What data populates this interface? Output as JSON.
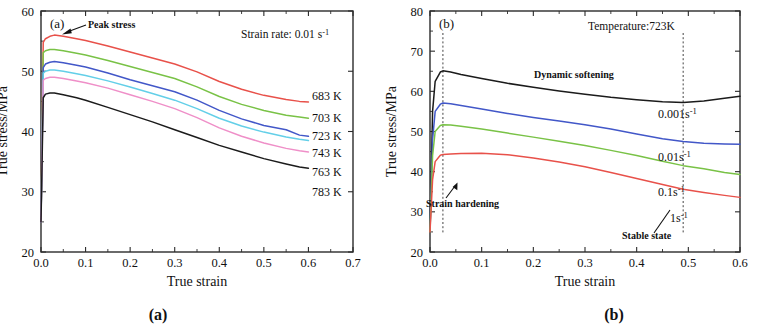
{
  "figure": {
    "caption_a": "(a)",
    "caption_b": "(b)"
  },
  "chart_data": [
    {
      "type": "line",
      "panel_label": "(a)",
      "title": "",
      "xlabel": "True strain",
      "ylabel": "True stress/MPa",
      "xlim": [
        0.0,
        0.7
      ],
      "ylim": [
        20,
        60
      ],
      "xticks": [
        "0.0",
        "0.1",
        "0.2",
        "0.3",
        "0.4",
        "0.5",
        "0.6",
        "0.7"
      ],
      "yticks": [
        "20",
        "30",
        "40",
        "50",
        "60"
      ],
      "grid": false,
      "legend_position": "right-inline",
      "annotations": [
        {
          "name": "condition-note",
          "text": "Strain rate: 0.01 s⁻¹"
        },
        {
          "name": "peak-stress-note",
          "text": "Peak stress"
        }
      ],
      "x": [
        0.0,
        0.005,
        0.01,
        0.02,
        0.03,
        0.05,
        0.08,
        0.1,
        0.15,
        0.2,
        0.25,
        0.3,
        0.35,
        0.4,
        0.45,
        0.5,
        0.55,
        0.58,
        0.6
      ],
      "series": [
        {
          "name": "683 K",
          "color": "#e8514a",
          "values": [
            25.0,
            54.8,
            55.4,
            55.8,
            56.0,
            55.8,
            55.4,
            55.1,
            54.2,
            53.2,
            52.2,
            51.2,
            49.9,
            48.3,
            47.0,
            46.0,
            45.3,
            45.0,
            44.9
          ]
        },
        {
          "name": "703 K",
          "color": "#79c246",
          "values": [
            25.0,
            53.1,
            53.4,
            53.6,
            53.6,
            53.4,
            53.0,
            52.7,
            51.8,
            50.8,
            49.8,
            48.8,
            47.4,
            45.8,
            44.5,
            43.5,
            42.7,
            42.4,
            42.2
          ]
        },
        {
          "name": "723 K",
          "color": "#4257c8",
          "values": [
            25.0,
            50.6,
            51.2,
            51.5,
            51.6,
            51.4,
            51.0,
            50.7,
            49.7,
            48.6,
            47.6,
            46.6,
            45.2,
            43.5,
            42.1,
            41.0,
            40.3,
            39.4,
            39.2
          ]
        },
        {
          "name": "743 K",
          "color": "#63cfe8",
          "values": [
            25.0,
            49.7,
            50.0,
            50.2,
            50.2,
            50.0,
            49.6,
            49.3,
            48.4,
            47.4,
            46.3,
            45.2,
            43.8,
            42.2,
            40.9,
            39.9,
            39.1,
            38.7,
            38.5
          ]
        },
        {
          "name": "763 K",
          "color": "#ef8fc8",
          "values": [
            25.0,
            48.5,
            48.8,
            49.0,
            49.0,
            48.8,
            48.4,
            48.1,
            47.2,
            46.1,
            45.0,
            43.8,
            42.3,
            40.6,
            39.2,
            38.1,
            37.2,
            36.8,
            36.6
          ]
        },
        {
          "name": "783 K",
          "color": "#1b1b1b",
          "values": [
            25.0,
            45.6,
            46.2,
            46.4,
            46.4,
            46.1,
            45.6,
            45.2,
            44.0,
            42.8,
            41.6,
            40.3,
            39.0,
            37.7,
            36.6,
            35.5,
            34.6,
            34.1,
            33.9
          ]
        }
      ]
    },
    {
      "type": "line",
      "panel_label": "(b)",
      "title": "",
      "xlabel": "True strain",
      "ylabel": "True stress/MPa",
      "xlim": [
        0.0,
        0.6
      ],
      "ylim": [
        20,
        80
      ],
      "xticks": [
        "0.0",
        "0.1",
        "0.2",
        "0.3",
        "0.4",
        "0.5",
        "0.6"
      ],
      "yticks": [
        "20",
        "30",
        "40",
        "50",
        "60",
        "70",
        "80"
      ],
      "grid": false,
      "legend_position": "right-inline",
      "annotations": [
        {
          "name": "condition-note",
          "text": "Temperature:723K"
        },
        {
          "name": "dynamic-softening-note",
          "text": "Dynamic softening"
        },
        {
          "name": "strain-hardening-note",
          "text": "Strain hardening"
        },
        {
          "name": "stable-state-note",
          "text": "Stable state"
        }
      ],
      "marker_lines": [
        0.025,
        0.49
      ],
      "x": [
        0.0,
        0.005,
        0.01,
        0.02,
        0.025,
        0.04,
        0.06,
        0.1,
        0.15,
        0.2,
        0.25,
        0.3,
        0.35,
        0.4,
        0.45,
        0.49,
        0.53,
        0.57,
        0.6
      ],
      "series": [
        {
          "name": "0.001s⁻¹",
          "color": "#1b1b1b",
          "values": [
            25.0,
            55.0,
            62.5,
            64.8,
            65.1,
            64.8,
            64.2,
            63.2,
            62.0,
            61.0,
            60.1,
            59.3,
            58.5,
            57.9,
            57.4,
            57.2,
            57.6,
            58.3,
            58.8
          ]
        },
        {
          "name": "0.01s⁻¹",
          "color": "#4257c8",
          "values": [
            25.0,
            48.0,
            55.0,
            56.8,
            57.1,
            56.9,
            56.5,
            55.6,
            54.5,
            53.5,
            52.6,
            51.7,
            50.6,
            49.4,
            48.2,
            47.5,
            47.1,
            46.9,
            46.8
          ]
        },
        {
          "name": "0.1s⁻¹",
          "color": "#79c246",
          "values": [
            25.0,
            44.0,
            50.0,
            51.5,
            51.7,
            51.6,
            51.3,
            50.6,
            49.6,
            48.6,
            47.6,
            46.5,
            45.3,
            44.0,
            42.6,
            41.5,
            40.7,
            39.8,
            39.3
          ]
        },
        {
          "name": "1s⁻¹",
          "color": "#e8514a",
          "values": [
            25.0,
            38.0,
            42.5,
            44.1,
            44.3,
            44.4,
            44.5,
            44.6,
            44.2,
            43.4,
            42.4,
            41.2,
            39.8,
            38.3,
            36.8,
            35.6,
            34.8,
            34.1,
            33.6
          ]
        }
      ]
    }
  ]
}
